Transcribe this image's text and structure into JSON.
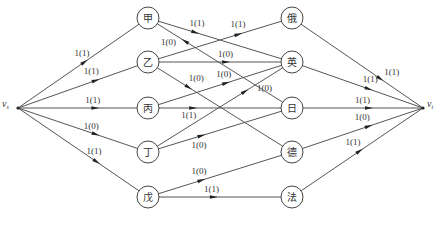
{
  "diagram": {
    "type": "network-flow",
    "nodes": [
      {
        "id": "vs",
        "label": "v",
        "sub": "s",
        "x": 18,
        "y": 108,
        "terminal": true
      },
      {
        "id": "jia",
        "label": "甲",
        "x": 148,
        "y": 18
      },
      {
        "id": "yi",
        "label": "乙",
        "x": 148,
        "y": 62
      },
      {
        "id": "bing",
        "label": "丙",
        "x": 148,
        "y": 108
      },
      {
        "id": "ding",
        "label": "丁",
        "x": 148,
        "y": 152
      },
      {
        "id": "wu",
        "label": "戊",
        "x": 148,
        "y": 197
      },
      {
        "id": "e",
        "label": "俄",
        "x": 292,
        "y": 18
      },
      {
        "id": "ying",
        "label": "英",
        "x": 292,
        "y": 62
      },
      {
        "id": "ri",
        "label": "日",
        "x": 292,
        "y": 108
      },
      {
        "id": "de",
        "label": "德",
        "x": 292,
        "y": 152
      },
      {
        "id": "fa",
        "label": "法",
        "x": 292,
        "y": 197
      },
      {
        "id": "vt",
        "label": "v",
        "sub": "t",
        "x": 423,
        "y": 108,
        "terminal": true
      }
    ],
    "edges": [
      {
        "from": "vs",
        "to": "jia",
        "label": "1(1)",
        "t": 0.55,
        "lx": -10,
        "ly": -6
      },
      {
        "from": "vs",
        "to": "yi",
        "label": "1(1)",
        "t": 0.65,
        "lx": -12,
        "ly": -6
      },
      {
        "from": "vs",
        "to": "bing",
        "label": "1(1)",
        "t": 0.65,
        "lx": -10,
        "ly": -5
      },
      {
        "from": "vs",
        "to": "ding",
        "label": "1(0)",
        "t": 0.65,
        "lx": -12,
        "ly": -5
      },
      {
        "from": "vs",
        "to": "wu",
        "label": "1(1)",
        "t": 0.65,
        "lx": -10,
        "ly": -8
      },
      {
        "from": "jia",
        "to": "ying",
        "label": "1(1)",
        "t": 0.3,
        "lx": -6,
        "ly": -6
      },
      {
        "from": "jia",
        "to": "ri",
        "label": "1(0)",
        "t": 0.22,
        "lx": -24,
        "ly": 4,
        "reverse_arrow": true
      },
      {
        "from": "yi",
        "to": "e",
        "label": "1(1)",
        "t": 0.65,
        "lx": -8,
        "ly": -7
      },
      {
        "from": "yi",
        "to": "ying",
        "label": "1(0)",
        "t": 0.55,
        "lx": -8,
        "ly": -5
      },
      {
        "from": "yi",
        "to": "de",
        "label": "1(0)",
        "t": 0.25,
        "lx": 0,
        "ly": -6
      },
      {
        "from": "bing",
        "to": "ying",
        "label": "1(0)",
        "t": 0.55,
        "lx": -10,
        "ly": -6
      },
      {
        "from": "bing",
        "to": "ri",
        "label": "1(1)",
        "t": 0.28,
        "lx": -12,
        "ly": 10
      },
      {
        "from": "ding",
        "to": "ying",
        "label": "1(0)",
        "t": 0.7,
        "lx": 12,
        "ly": 0
      },
      {
        "from": "ding",
        "to": "ri",
        "label": "1(0)",
        "t": 0.35,
        "lx": -10,
        "ly": 12
      },
      {
        "from": "wu",
        "to": "de",
        "label": "1(0)",
        "t": 0.35,
        "lx": -10,
        "ly": -6
      },
      {
        "from": "wu",
        "to": "fa",
        "label": "1(1)",
        "t": 0.45,
        "lx": -10,
        "ly": -5
      },
      {
        "from": "e",
        "to": "vt",
        "label": "1(1)",
        "t": 0.65,
        "lx": 4,
        "ly": -4
      },
      {
        "from": "ying",
        "to": "vt",
        "label": "1(1)",
        "t": 0.55,
        "lx": -6,
        "ly": -7
      },
      {
        "from": "ri",
        "to": "vt",
        "label": "1(1)",
        "t": 0.55,
        "lx": -14,
        "ly": -5
      },
      {
        "from": "de",
        "to": "vt",
        "label": "1(0)",
        "t": 0.55,
        "lx": -14,
        "ly": -6
      },
      {
        "from": "fa",
        "to": "vt",
        "label": "1(1)",
        "t": 0.48,
        "lx": -14,
        "ly": -6
      }
    ],
    "colors": {
      "stroke": "#555555",
      "text": "#333333",
      "background": "#ffffff"
    }
  }
}
